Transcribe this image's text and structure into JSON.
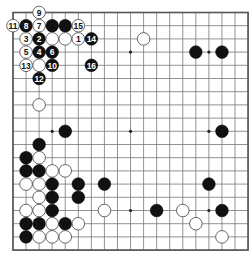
{
  "board": {
    "size": 19,
    "origin_x": 13,
    "origin_y": 12.5,
    "step_x": 13.06,
    "step_y": 13.2,
    "stone_radius": 6.3,
    "colors": {
      "black": "#111111",
      "white": "#ffffff",
      "grid": "#777777",
      "background": "#ffffff"
    },
    "star_points": [
      [
        3,
        3
      ],
      [
        9,
        3
      ],
      [
        15,
        3
      ],
      [
        3,
        9
      ],
      [
        9,
        9
      ],
      [
        15,
        9
      ],
      [
        3,
        15
      ],
      [
        9,
        15
      ],
      [
        15,
        15
      ]
    ]
  },
  "stones": [
    {
      "col": 2,
      "row": 0,
      "color": "white",
      "label": "9"
    },
    {
      "col": 0,
      "row": 1,
      "color": "white",
      "label": "11"
    },
    {
      "col": 1,
      "row": 1,
      "color": "black",
      "label": "8"
    },
    {
      "col": 2,
      "row": 1,
      "color": "white",
      "label": "7"
    },
    {
      "col": 3,
      "row": 1,
      "color": "black",
      "label": ""
    },
    {
      "col": 4,
      "row": 1,
      "color": "black",
      "label": ""
    },
    {
      "col": 5,
      "row": 1,
      "color": "white",
      "label": "15"
    },
    {
      "col": 1,
      "row": 2,
      "color": "white",
      "label": "3"
    },
    {
      "col": 2,
      "row": 2,
      "color": "black",
      "label": "2"
    },
    {
      "col": 3,
      "row": 2,
      "color": "white",
      "label": ""
    },
    {
      "col": 4,
      "row": 2,
      "color": "white",
      "label": ""
    },
    {
      "col": 5,
      "row": 2,
      "color": "white",
      "label": "1"
    },
    {
      "col": 6,
      "row": 2,
      "color": "black",
      "label": "14"
    },
    {
      "col": 10,
      "row": 2,
      "color": "white",
      "label": ""
    },
    {
      "col": 1,
      "row": 3,
      "color": "white",
      "label": "5"
    },
    {
      "col": 2,
      "row": 3,
      "color": "black",
      "label": "4"
    },
    {
      "col": 3,
      "row": 3,
      "color": "black",
      "label": "6"
    },
    {
      "col": 14,
      "row": 3,
      "color": "black",
      "label": ""
    },
    {
      "col": 16,
      "row": 3,
      "color": "black",
      "label": ""
    },
    {
      "col": 1,
      "row": 4,
      "color": "white",
      "label": "13"
    },
    {
      "col": 2,
      "row": 4,
      "color": "white",
      "label": ""
    },
    {
      "col": 3,
      "row": 4,
      "color": "black",
      "label": "10"
    },
    {
      "col": 6,
      "row": 4,
      "color": "black",
      "label": "16"
    },
    {
      "col": 2,
      "row": 5,
      "color": "black",
      "label": "12"
    },
    {
      "col": 2,
      "row": 7,
      "color": "white",
      "label": ""
    },
    {
      "col": 4,
      "row": 9,
      "color": "black",
      "label": ""
    },
    {
      "col": 16,
      "row": 9,
      "color": "black",
      "label": ""
    },
    {
      "col": 2,
      "row": 10,
      "color": "black",
      "label": ""
    },
    {
      "col": 1,
      "row": 11,
      "color": "black",
      "label": ""
    },
    {
      "col": 2,
      "row": 11,
      "color": "white",
      "label": ""
    },
    {
      "col": 1,
      "row": 12,
      "color": "black",
      "label": ""
    },
    {
      "col": 2,
      "row": 12,
      "color": "black",
      "label": ""
    },
    {
      "col": 3,
      "row": 12,
      "color": "white",
      "label": ""
    },
    {
      "col": 4,
      "row": 12,
      "color": "white",
      "label": ""
    },
    {
      "col": 1,
      "row": 13,
      "color": "white",
      "label": ""
    },
    {
      "col": 2,
      "row": 13,
      "color": "white",
      "label": ""
    },
    {
      "col": 3,
      "row": 13,
      "color": "black",
      "label": ""
    },
    {
      "col": 5,
      "row": 13,
      "color": "black",
      "label": ""
    },
    {
      "col": 7,
      "row": 13,
      "color": "black",
      "label": ""
    },
    {
      "col": 15,
      "row": 13,
      "color": "black",
      "label": ""
    },
    {
      "col": 2,
      "row": 14,
      "color": "white",
      "label": ""
    },
    {
      "col": 3,
      "row": 14,
      "color": "black",
      "label": ""
    },
    {
      "col": 5,
      "row": 14,
      "color": "black",
      "label": ""
    },
    {
      "col": 1,
      "row": 15,
      "color": "white",
      "label": ""
    },
    {
      "col": 2,
      "row": 15,
      "color": "white",
      "label": ""
    },
    {
      "col": 3,
      "row": 15,
      "color": "black",
      "label": ""
    },
    {
      "col": 7,
      "row": 15,
      "color": "white",
      "label": ""
    },
    {
      "col": 11,
      "row": 15,
      "color": "black",
      "label": ""
    },
    {
      "col": 13,
      "row": 15,
      "color": "white",
      "label": ""
    },
    {
      "col": 16,
      "row": 15,
      "color": "black",
      "label": ""
    },
    {
      "col": 1,
      "row": 16,
      "color": "black",
      "label": ""
    },
    {
      "col": 2,
      "row": 16,
      "color": "black",
      "label": ""
    },
    {
      "col": 3,
      "row": 16,
      "color": "white",
      "label": ""
    },
    {
      "col": 4,
      "row": 16,
      "color": "black",
      "label": ""
    },
    {
      "col": 5,
      "row": 16,
      "color": "white",
      "label": ""
    },
    {
      "col": 14,
      "row": 16,
      "color": "white",
      "label": ""
    },
    {
      "col": 1,
      "row": 17,
      "color": "black",
      "label": ""
    },
    {
      "col": 2,
      "row": 17,
      "color": "white",
      "label": ""
    },
    {
      "col": 3,
      "row": 17,
      "color": "white",
      "label": ""
    },
    {
      "col": 4,
      "row": 17,
      "color": "white",
      "label": ""
    },
    {
      "col": 16,
      "row": 17,
      "color": "white",
      "label": ""
    }
  ]
}
